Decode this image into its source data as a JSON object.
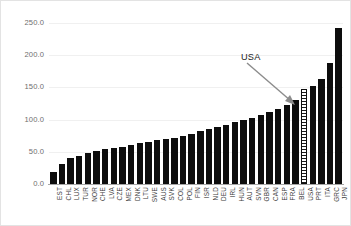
{
  "chart_data": {
    "type": "bar",
    "title": "",
    "subtitle": "",
    "xlabel": "",
    "ylabel": "",
    "ylim": [
      0,
      250
    ],
    "grid": true,
    "legend": null,
    "yticks": [
      "0.0",
      "50.0",
      "100.0",
      "150.0",
      "200.0",
      "250.0"
    ],
    "ytick_values": [
      0,
      50,
      100,
      150,
      200,
      250
    ],
    "categories": [
      "EST",
      "CHL",
      "LUX",
      "TUR",
      "NOR",
      "CHE",
      "LVA",
      "CZE",
      "MEX",
      "DNK",
      "LTU",
      "SWE",
      "AUS",
      "SVK",
      "COL",
      "POL",
      "FIN",
      "ISR",
      "NLD",
      "DEU",
      "IRL",
      "HUN",
      "AUT",
      "SVN",
      "GBR",
      "CAN",
      "ESP",
      "FRA",
      "BEL",
      "USA",
      "PRT",
      "ITA",
      "GRC",
      "JPN"
    ],
    "values": [
      18,
      31,
      41,
      44,
      48,
      52,
      54,
      56,
      58,
      61,
      63,
      65,
      68,
      70,
      72,
      75,
      78,
      82,
      85,
      88,
      92,
      96,
      99,
      103,
      107,
      112,
      116,
      122,
      130,
      147,
      152,
      163,
      188,
      243
    ],
    "highlight_category": "USA",
    "highlight_style": "hatched",
    "annotations": [
      {
        "text": "USA",
        "target_category": "USA",
        "arrow": true,
        "arrow_color": "#7f7f7f"
      }
    ],
    "bar_color": "#0d0d0d",
    "grid_color": "#f0f0f0",
    "axis_color": "#a6a6a6"
  }
}
